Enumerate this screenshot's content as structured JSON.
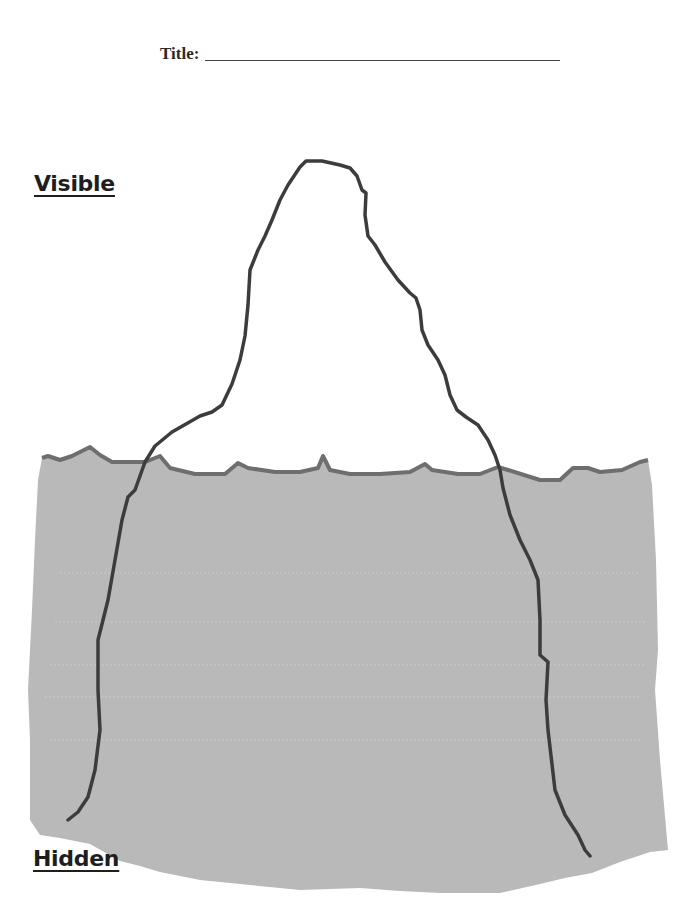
{
  "worksheet": {
    "title_label": "Title:",
    "title_value": "",
    "sections": {
      "visible": "Visible",
      "hidden": "Hidden"
    }
  },
  "colors": {
    "water_fill": "#b9b9b9",
    "waterline": "#6e6e6e",
    "iceberg_outline": "#3c3c3c",
    "text": "#1e1e1e"
  }
}
